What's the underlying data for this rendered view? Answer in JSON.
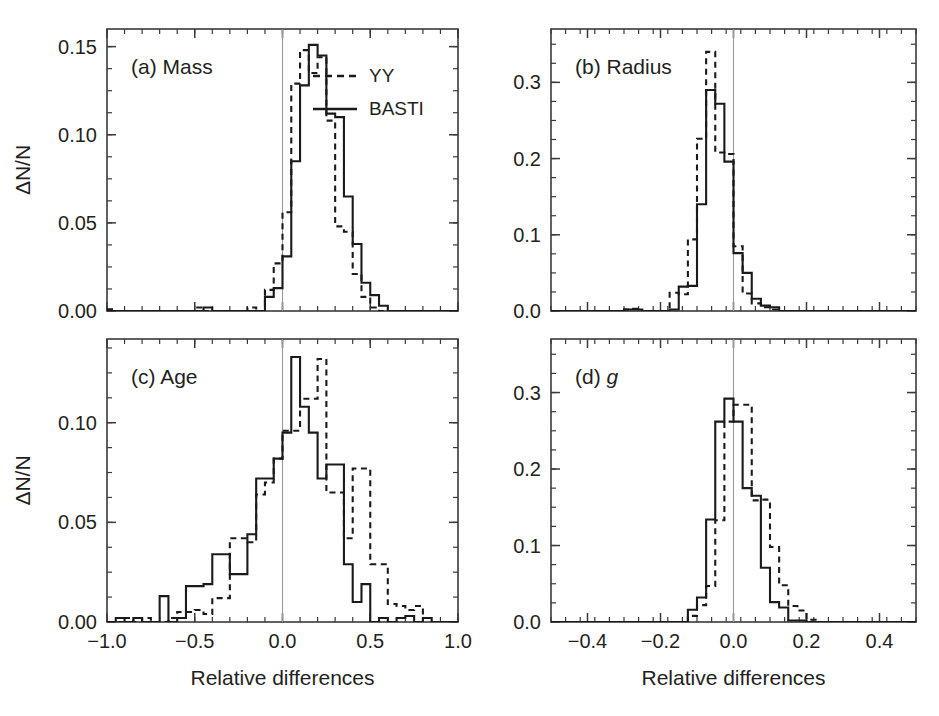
{
  "figure": {
    "background_color": "#ffffff",
    "line_color": "#1a1a1a",
    "axis_color": "#3a3a3a",
    "zero_line_color": "#9a9a9a",
    "shared_ylabel": "ΔN/N",
    "shared_xlabel": "Relative differences"
  },
  "legend": {
    "position": "panel-a-upper-right",
    "entries": [
      {
        "label": "YY",
        "style": "dashed"
      },
      {
        "label": "BASTI",
        "style": "solid"
      }
    ]
  },
  "chart_data": [
    {
      "id": "panel-a",
      "type": "line",
      "title": "(a) Mass",
      "panel_letter": "(a)",
      "panel_name": "Mass",
      "xlabel": "Relative differences",
      "ylabel": "ΔN/N",
      "xlim": [
        -1.0,
        1.0
      ],
      "ylim": [
        0.0,
        0.16
      ],
      "xticks": [
        -1.0,
        -0.5,
        0.0,
        0.5,
        1.0
      ],
      "xticklabels": [
        "-1.0",
        "-0.5",
        "0.0",
        "0.5",
        "1.0"
      ],
      "yticks": [
        0.0,
        0.05,
        0.1,
        0.15
      ],
      "yticklabels": [
        "0.00",
        "0.05",
        "0.10",
        "0.15"
      ],
      "x_minor_step": 0.1,
      "y_minor_step": 0.0125,
      "bin_width": 0.05,
      "bin_edges_start": -1.0,
      "grid": false,
      "zero_line": 0.0,
      "series": [
        {
          "name": "BASTI",
          "style": "solid",
          "values": [
            0.0,
            0.0,
            0.0,
            0.0,
            0.0,
            0.0,
            0.0,
            0.0,
            0.0,
            0.0,
            0.0,
            0.002,
            0.0,
            0.0,
            0.0,
            0.0,
            0.0,
            0.0,
            0.008,
            0.013,
            0.031,
            0.085,
            0.128,
            0.151,
            0.145,
            0.112,
            0.11,
            0.065,
            0.038,
            0.016,
            0.009,
            0.003,
            0.0,
            0.0,
            0.0,
            0.0,
            0.0,
            0.0,
            0.0,
            0.0
          ]
        },
        {
          "name": "YY",
          "style": "dashed",
          "values": [
            0.001,
            0.0,
            0.0,
            0.0,
            0.0,
            0.0,
            0.0,
            0.0,
            0.0,
            0.0,
            0.002,
            0.0,
            0.0,
            0.0,
            0.0,
            0.0,
            0.002,
            0.0,
            0.012,
            0.027,
            0.056,
            0.129,
            0.148,
            0.135,
            0.144,
            0.108,
            0.048,
            0.045,
            0.021,
            0.008,
            0.002,
            0.0,
            0.0,
            0.0,
            0.0,
            0.0,
            0.0,
            0.0,
            0.0,
            0.0
          ]
        }
      ]
    },
    {
      "id": "panel-b",
      "type": "line",
      "title": "(b) Radius",
      "panel_letter": "(b)",
      "panel_name": "Radius",
      "xlabel": "Relative differences",
      "ylabel": "ΔN/N",
      "xlim": [
        -0.5,
        0.5
      ],
      "ylim": [
        0.0,
        0.37
      ],
      "xticks": [
        -0.4,
        -0.2,
        0.0,
        0.2,
        0.4
      ],
      "xticklabels": [
        "-0.4",
        "-0.2",
        "0.0",
        "0.2",
        "0.4"
      ],
      "yticks": [
        0.0,
        0.1,
        0.2,
        0.3
      ],
      "yticklabels": [
        "0.0",
        "0.1",
        "0.2",
        "0.3"
      ],
      "x_minor_step": 0.04,
      "y_minor_step": 0.025,
      "bin_width": 0.025,
      "bin_edges_start": -0.5,
      "grid": false,
      "zero_line": 0.0,
      "series": [
        {
          "name": "BASTI",
          "style": "solid",
          "values": [
            0.0,
            0.0,
            0.0,
            0.0,
            0.0,
            0.0,
            0.0,
            0.0,
            0.002,
            0.002,
            0.0,
            0.0,
            0.0,
            0.002,
            0.032,
            0.033,
            0.14,
            0.29,
            0.272,
            0.196,
            0.076,
            0.05,
            0.016,
            0.007,
            0.005,
            0.0,
            0.0,
            0.0,
            0.0,
            0.0,
            0.0,
            0.0,
            0.0,
            0.0,
            0.0,
            0.0,
            0.0,
            0.0,
            0.0,
            0.0
          ]
        },
        {
          "name": "YY",
          "style": "dashed",
          "values": [
            0.0,
            0.0,
            0.0,
            0.0,
            0.0,
            0.0,
            0.0,
            0.0,
            0.002,
            0.003,
            0.0,
            0.0,
            0.0,
            0.024,
            0.022,
            0.094,
            0.226,
            0.34,
            0.208,
            0.206,
            0.085,
            0.023,
            0.01,
            0.005,
            0.002,
            0.0,
            0.0,
            0.0,
            0.0,
            0.0,
            0.0,
            0.0,
            0.0,
            0.0,
            0.0,
            0.0,
            0.0,
            0.0,
            0.0,
            0.0
          ]
        }
      ]
    },
    {
      "id": "panel-c",
      "type": "line",
      "title": "(c) Age",
      "panel_letter": "(c)",
      "panel_name": "Age",
      "xlabel": "Relative differences",
      "ylabel": "ΔN/N",
      "xlim": [
        -1.0,
        1.0
      ],
      "ylim": [
        0.0,
        0.142
      ],
      "xticks": [
        -1.0,
        -0.5,
        0.0,
        0.5,
        1.0
      ],
      "xticklabels": [
        "-1.0",
        "-0.5",
        "0.0",
        "0.5",
        "1.0"
      ],
      "yticks": [
        0.0,
        0.05,
        0.1
      ],
      "yticklabels": [
        "0.00",
        "0.05",
        "0.10"
      ],
      "x_minor_step": 0.1,
      "y_minor_step": 0.0125,
      "bin_width": 0.05,
      "bin_edges_start": -1.0,
      "grid": false,
      "zero_line": 0.0,
      "series": [
        {
          "name": "BASTI",
          "style": "solid",
          "values": [
            0.0,
            0.002,
            0.0,
            0.002,
            0.0,
            0.0,
            0.013,
            0.0,
            0.002,
            0.018,
            0.018,
            0.019,
            0.034,
            0.034,
            0.024,
            0.024,
            0.044,
            0.072,
            0.072,
            0.082,
            0.095,
            0.133,
            0.108,
            0.095,
            0.072,
            0.079,
            0.079,
            0.029,
            0.01,
            0.019,
            0.0,
            0.002,
            0.0,
            0.002,
            0.003,
            0.0,
            0.002,
            0.0,
            0.0,
            0.0
          ]
        },
        {
          "name": "YY",
          "style": "dashed",
          "values": [
            0.0,
            0.0,
            0.002,
            0.0,
            0.002,
            0.0,
            0.0,
            0.002,
            0.005,
            0.005,
            0.006,
            0.004,
            0.012,
            0.012,
            0.042,
            0.042,
            0.04,
            0.064,
            0.07,
            0.082,
            0.096,
            0.096,
            0.112,
            0.112,
            0.132,
            0.065,
            0.065,
            0.042,
            0.077,
            0.077,
            0.029,
            0.029,
            0.009,
            0.008,
            0.006,
            0.008,
            0.002,
            0.0,
            0.0,
            0.0
          ]
        }
      ]
    },
    {
      "id": "panel-d",
      "type": "line",
      "title": "(d) g",
      "panel_letter": "(d)",
      "panel_name": "g",
      "panel_name_italic": true,
      "xlabel": "Relative differences",
      "ylabel": "ΔN/N",
      "xlim": [
        -0.5,
        0.5
      ],
      "ylim": [
        0.0,
        0.37
      ],
      "xticks": [
        -0.4,
        -0.2,
        0.0,
        0.2,
        0.4
      ],
      "xticklabels": [
        "-0.4",
        "-0.2",
        "0.0",
        "0.2",
        "0.4"
      ],
      "yticks": [
        0.0,
        0.1,
        0.2,
        0.3
      ],
      "yticklabels": [
        "0.0",
        "0.1",
        "0.2",
        "0.3"
      ],
      "x_minor_step": 0.04,
      "y_minor_step": 0.025,
      "bin_width": 0.025,
      "bin_edges_start": -0.5,
      "grid": false,
      "zero_line": 0.0,
      "series": [
        {
          "name": "BASTI",
          "style": "solid",
          "values": [
            0.0,
            0.0,
            0.0,
            0.0,
            0.0,
            0.0,
            0.0,
            0.0,
            0.0,
            0.0,
            0.0,
            0.0,
            0.0,
            0.0,
            0.0,
            0.016,
            0.032,
            0.134,
            0.262,
            0.292,
            0.262,
            0.175,
            0.165,
            0.071,
            0.026,
            0.019,
            0.002,
            0.002,
            0.0,
            0.0,
            0.0,
            0.0,
            0.0,
            0.0,
            0.0,
            0.0,
            0.0,
            0.0,
            0.0,
            0.0
          ]
        },
        {
          "name": "YY",
          "style": "dashed",
          "values": [
            0.0,
            0.0,
            0.0,
            0.0,
            0.0,
            0.0,
            0.0,
            0.0,
            0.0,
            0.0,
            0.0,
            0.0,
            0.0,
            0.0,
            0.0,
            0.008,
            0.022,
            0.047,
            0.133,
            0.262,
            0.284,
            0.284,
            0.159,
            0.16,
            0.098,
            0.048,
            0.021,
            0.015,
            0.003,
            0.0,
            0.0,
            0.0,
            0.0,
            0.0,
            0.0,
            0.0,
            0.0,
            0.0,
            0.0,
            0.0
          ]
        }
      ]
    }
  ]
}
